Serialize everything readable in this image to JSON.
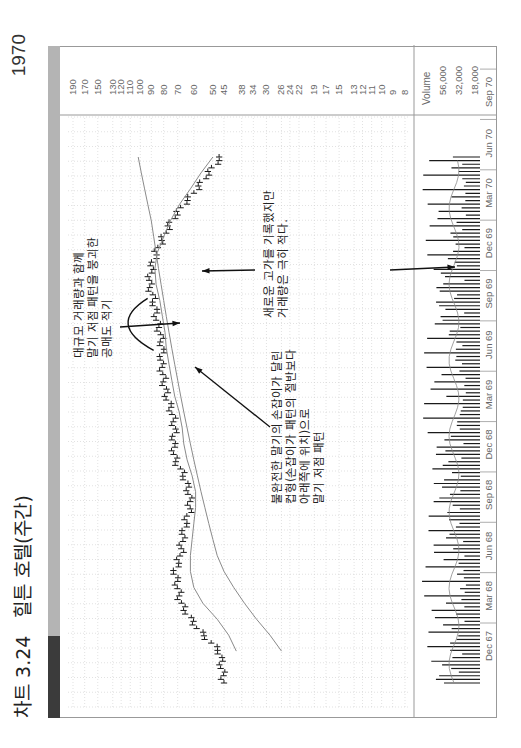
{
  "header": {
    "figure_number": "차트 3.24",
    "title": "힐튼 호텔(주간)",
    "year": "1970"
  },
  "colors": {
    "band_dark": "#3b3b3b",
    "band_light": "#b4b4b4",
    "price_bar": "#1a1a1a",
    "moving_average": "#8a8a8a",
    "volume_bar": "#1a1a1a",
    "grid": "#cfcfcf"
  },
  "price_scale": {
    "label": "Price Scale",
    "ticks": [
      "190",
      "170",
      "150",
      "130",
      "120",
      "110",
      "100",
      "90",
      "80",
      "70",
      "60",
      "50",
      "45",
      "38",
      "34",
      "30",
      "26",
      "24",
      "22",
      "19",
      "17",
      "15",
      "13",
      "12",
      "11",
      "10",
      "9",
      "8"
    ]
  },
  "volume_scale": {
    "label": "Volume",
    "ticks": [
      "56,000",
      "32,000",
      "18,000"
    ]
  },
  "date_axis": {
    "labels": [
      "Dec 67",
      "Mar 68",
      "Jun 68",
      "Sep 68",
      "Dec 68",
      "Mar 69",
      "Jun 69",
      "Sep 69",
      "Dec 69",
      "Mar 70",
      "Jun 70",
      "Sep 70"
    ]
  },
  "annotations": [
    {
      "id": "short-sale",
      "text": "대규모 거래량과 함께\n말기 저점 패턴을 붕괴한\n공매도 적기"
    },
    {
      "id": "new-high",
      "text": "새로운 고가를 기록했지만\n거래량은 극히 적다."
    },
    {
      "id": "cup-handle",
      "text": "불완전한 말기의 손잡이가 달린\n컵형(손잡이가 패턴의 절반보다\n아래쪽에 위치)으로\n말기 저점 패턴"
    }
  ],
  "chart_data": {
    "type": "line",
    "title": "힐튼 호텔(주간)",
    "subtitle": "차트 3.24",
    "xlabel": "",
    "ylabel": "Price Scale",
    "y_scale": "log",
    "ylim": [
      8,
      190
    ],
    "grid": true,
    "x": [
      "Oct 67",
      "Nov 67",
      "Dec 67",
      "Jan 68",
      "Feb 68",
      "Mar 68",
      "Apr 68",
      "May 68",
      "Jun 68",
      "Jul 68",
      "Aug 68",
      "Sep 68",
      "Oct 68",
      "Nov 68",
      "Dec 68",
      "Jan 69",
      "Feb 69",
      "Mar 69",
      "Apr 69",
      "May 69",
      "Jun 69",
      "Jul 69",
      "Aug 69",
      "Sep 69",
      "Oct 69",
      "Nov 69",
      "Dec 69",
      "Jan 70",
      "Feb 70",
      "Mar 70",
      "Apr 70",
      "May 70",
      "Jun 70",
      "Jul 70"
    ],
    "series": [
      {
        "name": "Weekly price (monthly approx.)",
        "values": [
          45,
          46,
          47,
          55,
          62,
          68,
          70,
          72,
          68,
          67,
          65,
          62,
          63,
          66,
          72,
          73,
          72,
          74,
          78,
          80,
          82,
          81,
          83,
          86,
          88,
          92,
          90,
          86,
          80,
          74,
          66,
          58,
          52,
          46
        ]
      },
      {
        "name": "Moving average (short)",
        "values": [
          null,
          null,
          40,
          43,
          48,
          55,
          60,
          62,
          62,
          61,
          60,
          59,
          59,
          61,
          64,
          66,
          67,
          69,
          72,
          74,
          76,
          78,
          79,
          81,
          83,
          86,
          87,
          85,
          80,
          75,
          69,
          62,
          56,
          50
        ]
      },
      {
        "name": "Moving average (long)",
        "values": [
          null,
          null,
          26,
          29,
          33,
          37,
          41,
          45,
          48,
          50,
          52,
          54,
          56,
          58,
          60,
          62,
          64,
          66,
          68,
          70,
          72,
          74,
          76,
          78,
          80,
          82,
          84,
          86,
          88,
          90,
          93,
          96,
          99,
          102
        ]
      }
    ],
    "volume": {
      "ylabel": "Volume",
      "ticks": [
        56000,
        32000,
        18000
      ]
    },
    "annotations": [
      "대규모 거래량과 함께 말기 저점 패턴을 붕괴한 공매도 적기",
      "새로운 고가를 기록했지만 거래량은 극히 적다.",
      "불완전한 말기의 손잡이가 달린 컵형(손잡이가 패턴의 절반보다 아래쪽에 위치)으로 말기 저점 패턴"
    ],
    "legend": "none"
  }
}
